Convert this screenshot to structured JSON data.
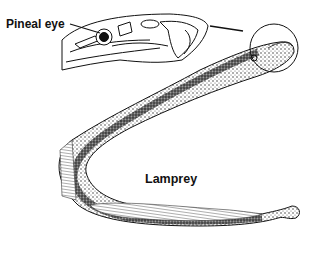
{
  "figure": {
    "labels": {
      "pineal_eye": "Pineal eye",
      "lamprey": "Lamprey"
    },
    "parts": [
      {
        "name": "head-detail-inset",
        "description": "Dorsal head detail with pineal eye"
      },
      {
        "name": "magnification-circle",
        "description": "Circle around lamprey head linked to inset"
      },
      {
        "name": "lamprey-body",
        "description": "Stippled U-shaped eel-like body"
      },
      {
        "name": "tail-fin",
        "description": "Tail at lower right"
      }
    ],
    "colors": {
      "ink": "#111111",
      "background": "#ffffff"
    }
  }
}
